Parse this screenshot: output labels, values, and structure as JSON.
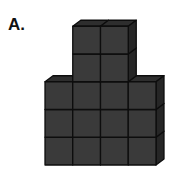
{
  "figure": {
    "label": "A.",
    "colors": {
      "cube_face": "#3a3a3a",
      "cube_top": "#2e2e2e",
      "cube_side": "#262626",
      "edge": "#0d0d0d"
    },
    "bottom_block": {
      "columns": 4,
      "rows": 3
    },
    "top_tower": {
      "columns": 2,
      "rows": 2,
      "column_offset": 1
    },
    "total_cubes_visible_front": 16
  }
}
